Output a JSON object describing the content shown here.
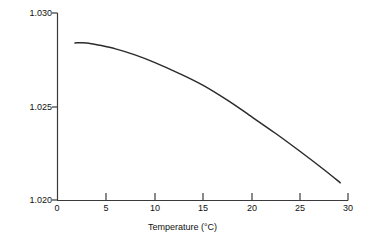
{
  "chart_data": {
    "type": "line",
    "title": "",
    "xlabel": "Temperature (°C)",
    "ylabel": "Density (gm/cm³)",
    "ylabel_base": "Density (gm/cm",
    "ylabel_exponent": "3",
    "ylabel_close": ")",
    "xlabel_base": "Temperature (°C)",
    "xlim": [
      0,
      30
    ],
    "ylim": [
      1.02,
      1.03
    ],
    "grid": false,
    "legend": false,
    "xticks": [
      0,
      5,
      10,
      15,
      20,
      25,
      30
    ],
    "xtick_labels": [
      "0",
      "5",
      "10",
      "15",
      "20",
      "25",
      "30"
    ],
    "yticks": [
      1.02,
      1.025,
      1.03
    ],
    "ytick_labels": [
      "1.020",
      "1.025",
      "1.030"
    ],
    "series": [
      {
        "name": "density-vs-temperature",
        "color": "#2b2b2b",
        "x": [
          1.8,
          3,
          4.4,
          6,
          8,
          10,
          12.6,
          15,
          17.5,
          19.8,
          22.5,
          25,
          27.5,
          29.2
        ],
        "y": [
          1.0284,
          1.0284,
          1.02827,
          1.02808,
          1.02776,
          1.02736,
          1.02676,
          1.02614,
          1.02535,
          1.02454,
          1.02357,
          1.02262,
          1.02163,
          1.02092
        ]
      }
    ],
    "axis_color": "#3a3a3a",
    "curve_color": "#2b2b2b",
    "background_color": "#ffffff"
  },
  "axes": {
    "y_tick_labels": [
      {
        "value": "1.030",
        "top": 9
      },
      {
        "value": "1.025",
        "top": 103
      },
      {
        "value": "1.020",
        "top": 196
      }
    ],
    "x_tick_labels": [
      {
        "value": "0",
        "left": 57
      },
      {
        "value": "5",
        "left": 106
      },
      {
        "value": "10",
        "left": 155
      },
      {
        "value": "15",
        "left": 203
      },
      {
        "value": "20",
        "left": 252
      },
      {
        "value": "25",
        "left": 300
      },
      {
        "value": "30",
        "left": 348
      }
    ]
  }
}
